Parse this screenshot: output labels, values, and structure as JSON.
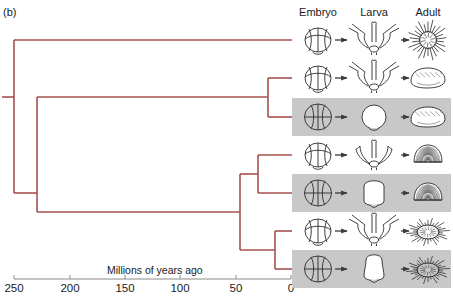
{
  "figure": {
    "panel_label": "(b)",
    "line_color": "#a5514e",
    "highlight_color": "#c8c8c8",
    "ink_color": "#2b2b2b"
  },
  "columns": [
    {
      "id": "embryo",
      "label": "Embryo",
      "x": 318
    },
    {
      "id": "larva",
      "label": "Larva",
      "x": 374
    },
    {
      "id": "adult",
      "label": "Adult",
      "x": 428
    }
  ],
  "axis": {
    "title": "Millions of years ago",
    "title_x": 107,
    "title_y": 264,
    "line_y": 279,
    "x_left": 14,
    "x_right": 291,
    "ticks": [
      {
        "value": "250",
        "x": 14
      },
      {
        "value": "200",
        "x": 70
      },
      {
        "value": "150",
        "x": 125
      },
      {
        "value": "100",
        "x": 180
      },
      {
        "value": "50",
        "x": 236
      },
      {
        "value": "0",
        "x": 291
      }
    ]
  },
  "chart_data": {
    "type": "diagram",
    "xlabel": "Millions of years ago",
    "xlim": [
      250,
      0
    ],
    "grid": false,
    "legend": false,
    "taxa": [
      {
        "row": 1,
        "y": 40,
        "divergence_mya": 250,
        "embryo": "cleavage-embryo-blastomeres",
        "larva": "pluteus-long-arms",
        "adult": "urchin-spiny-round",
        "highlighted": false
      },
      {
        "row": 2,
        "y": 78,
        "divergence_mya": 25,
        "embryo": "cleavage-embryo-blastomeres",
        "larva": "pluteus-long-arms",
        "adult": "heart-urchin-oval-smooth",
        "highlighted": false
      },
      {
        "row": 3,
        "y": 117,
        "divergence_mya": 25,
        "embryo": "direct-embryo-large",
        "larva": "direct-larva-round",
        "adult": "heart-urchin-oval-smooth",
        "highlighted": true
      },
      {
        "row": 4,
        "y": 155,
        "divergence_mya": 33,
        "embryo": "cleavage-embryo-blastomeres",
        "larva": "pluteus-short-arms",
        "adult": "sand-dollar-dome",
        "highlighted": false
      },
      {
        "row": 5,
        "y": 193,
        "divergence_mya": 33,
        "embryo": "direct-embryo-large",
        "larva": "direct-larva-oval",
        "adult": "sand-dollar-dome",
        "highlighted": true
      },
      {
        "row": 6,
        "y": 231,
        "divergence_mya": 18,
        "embryo": "cleavage-embryo-blastomeres",
        "larva": "pluteus-long-arms",
        "adult": "urchin-spiny-flat",
        "highlighted": false
      },
      {
        "row": 7,
        "y": 269,
        "divergence_mya": 18,
        "embryo": "direct-embryo-large",
        "larva": "direct-larva-tall",
        "adult": "urchin-spiny-flat",
        "highlighted": true
      }
    ],
    "nodes": [
      {
        "id": "root",
        "x": 14,
        "mya": 250,
        "children_y": [
          40,
          193
        ]
      },
      {
        "id": "node-crown",
        "x": 37,
        "mya": 229,
        "children_y": [
          97,
          212
        ]
      },
      {
        "id": "node-ab",
        "x": 268,
        "mya": 25,
        "children_y": [
          78,
          117
        ]
      },
      {
        "id": "node-lower",
        "x": 240,
        "mya": 50,
        "children_y": [
          174,
          250
        ]
      },
      {
        "id": "node-cd",
        "x": 258,
        "mya": 33,
        "children_y": [
          155,
          193
        ]
      },
      {
        "id": "node-ef",
        "x": 275,
        "mya": 18,
        "children_y": [
          231,
          269
        ]
      }
    ]
  }
}
